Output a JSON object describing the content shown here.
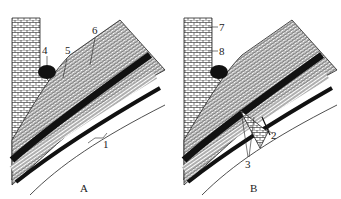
{
  "figure": {
    "panels": [
      {
        "id": "A",
        "caption": "A",
        "labels": [
          {
            "text": "1",
            "x": 103,
            "y": 143
          },
          {
            "text": "4",
            "x": 18,
            "y": 58
          },
          {
            "text": "5",
            "x": 39,
            "y": 58
          },
          {
            "text": "6",
            "x": 63,
            "y": 36
          }
        ]
      },
      {
        "id": "B",
        "caption": "B",
        "labels": [
          {
            "text": "2",
            "x": 101,
            "y": 137
          },
          {
            "text": "3",
            "x": 78,
            "y": 168
          },
          {
            "text": "7",
            "x": 49,
            "y": 32
          },
          {
            "text": "8",
            "x": 49,
            "y": 55
          }
        ]
      }
    ],
    "colors": {
      "ink": "#1a1a1a",
      "paper": "#ffffff",
      "bud": "#111111"
    }
  }
}
